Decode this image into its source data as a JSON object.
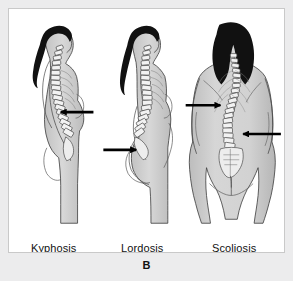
{
  "figure": {
    "panel_letter": "B",
    "background_color": "#ececed",
    "panel_color": "#ffffff",
    "border_color": "#c9c9c9",
    "ink_color": "#111111",
    "skin_color": "#d2d2d2",
    "skin_shadow_color": "#b4b4b4",
    "bone_color": "#f2f2f2",
    "hair_color": "#111111",
    "arrow_color": "#000000"
  },
  "panels": [
    {
      "id": "kyphosis",
      "label": "Kyphosis",
      "view": "left-facing lateral profile",
      "description": "Exaggerated outward thoracic curvature producing a rounded upper back hump",
      "arrows": [
        {
          "direction": "left",
          "points_at": "thoracic hump"
        }
      ]
    },
    {
      "id": "lordosis",
      "label": "Lordosis",
      "view": "left-facing lateral profile",
      "description": "Exaggerated inward lumbar curvature with protruding abdomen and buttocks",
      "arrows": [
        {
          "direction": "right",
          "points_at": "lumbar inward curve"
        }
      ]
    },
    {
      "id": "scoliosis",
      "label": "Scoliosis",
      "view": "posterior back view",
      "description": "Lateral S-shaped curvature of the vertebral column",
      "arrows": [
        {
          "direction": "right",
          "points_at": "upper thoracic convexity"
        },
        {
          "direction": "left",
          "points_at": "lower lumbar convexity"
        }
      ]
    }
  ]
}
